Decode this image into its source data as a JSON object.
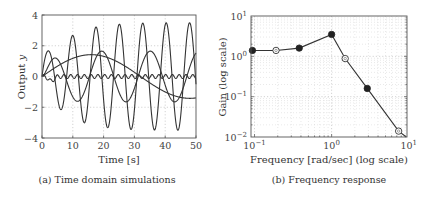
{
  "chart_data": [
    {
      "id": "time-domain",
      "type": "line",
      "title": "",
      "caption": "(a) Time domain simulations",
      "xlabel": "Time [s]",
      "ylabel": "Output y",
      "xlim": [
        0,
        50
      ],
      "ylim": [
        -4,
        4
      ],
      "xticks": [
        0,
        10,
        20,
        30,
        40,
        50
      ],
      "yticks": [
        -4,
        -2,
        0,
        2,
        4
      ],
      "xtick_labels": [
        "0",
        "10",
        "20",
        "30",
        "40",
        "50"
      ],
      "ytick_labels": [
        "−4",
        "−2",
        "0",
        "2",
        "4"
      ],
      "grid": true,
      "legend": null,
      "line_color": "#333333",
      "series": [
        {
          "name": "large fast oscillation",
          "kind": "sine",
          "amplitude": 3.5,
          "period": 7.6,
          "phase_shift": 1.9,
          "ramp": 7.0
        },
        {
          "name": "medium oscillation",
          "kind": "sine",
          "amplitude": 1.65,
          "period": 15.8,
          "phase_shift": 1.1,
          "ramp": 3.0
        },
        {
          "name": "slow response",
          "kind": "sine_slow",
          "amplitude": 1.42,
          "period": 64.0,
          "phase_shift": 0,
          "settle": 1.42
        },
        {
          "name": "small ripple",
          "kind": "ripple",
          "amplitude": 0.13,
          "period": 2.2,
          "dip": -0.3
        }
      ]
    },
    {
      "id": "frequency-response",
      "type": "line",
      "title": "",
      "caption": "(b) Frequency response",
      "xlabel": "Frequency [rad/sec] (log scale)",
      "ylabel": "Gain (log scale)",
      "xscale": "log",
      "yscale": "log",
      "xlim": [
        0.09,
        9.5
      ],
      "ylim": [
        0.01,
        10
      ],
      "xticks": [
        0.1,
        1,
        10
      ],
      "yticks": [
        0.01,
        0.1,
        1,
        10
      ],
      "xtick_labels": [
        [
          "10",
          "−1"
        ],
        [
          "10",
          "0"
        ],
        [
          "10",
          "1"
        ]
      ],
      "ytick_labels": [
        [
          "10",
          "−2"
        ],
        [
          "10",
          "−1"
        ],
        [
          "10",
          "0"
        ],
        [
          "10",
          "1"
        ]
      ],
      "grid": true,
      "legend": null,
      "line_color": "#333333",
      "x": [
        0.094,
        0.19,
        0.38,
        1.0,
        1.5,
        2.9,
        7.4,
        9.3
      ],
      "y": [
        1.4,
        1.4,
        1.6,
        3.5,
        0.88,
        0.16,
        0.014,
        0.0085
      ],
      "markers": [
        "filled",
        "open",
        "filled",
        "filled",
        "open",
        "filled",
        "open",
        "none"
      ]
    }
  ]
}
